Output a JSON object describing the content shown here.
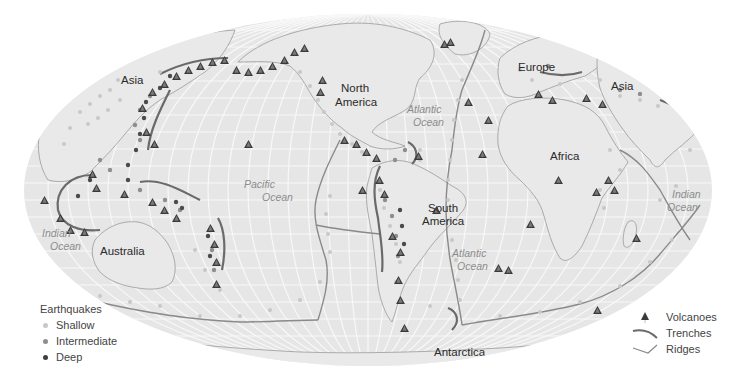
{
  "map": {
    "projection": "Mollweide-style ellipse",
    "land_labels": {
      "asia_west": "Asia",
      "asia_east": "Asia",
      "north_america": "North America",
      "north_america_l1": "North",
      "north_america_l2": "America",
      "south_america_l1": "South",
      "south_america_l2": "America",
      "europe": "Europe",
      "africa": "Africa",
      "australia": "Australia",
      "antarctica": "Antarctica"
    },
    "ocean_labels": {
      "pacific_l1": "Pacific",
      "pacific_l2": "Ocean",
      "atlantic_north_l1": "Atlantic",
      "atlantic_north_l2": "Ocean",
      "atlantic_south_l1": "Atlantic",
      "atlantic_south_l2": "Ocean",
      "indian_west_l1": "Indian",
      "indian_west_l2": "Ocean",
      "indian_east_l1": "Indian",
      "indian_east_l2": "Ocean"
    },
    "colors": {
      "ocean_fill": "#e6e6e6",
      "grid": "#f7f7f7",
      "coast": "#9a9a9a",
      "trench": "#6f6f6f",
      "ridge": "#8a8a8a",
      "shallow": "#c8c8c8",
      "intermediate": "#8e8e8e",
      "deep": "#4a4a4a",
      "volcano": "#3a3a3a"
    }
  },
  "legend_earthquakes": {
    "title": "Earthquakes",
    "items": [
      {
        "label": "Shallow",
        "color": "#c8c8c8"
      },
      {
        "label": "Intermediate",
        "color": "#8e8e8e"
      },
      {
        "label": "Deep",
        "color": "#3f3f3f"
      }
    ]
  },
  "legend_features": {
    "items": [
      {
        "label": "Volcanoes",
        "icon": "volcano-triangle-icon"
      },
      {
        "label": "Trenches",
        "icon": "trench-line-icon"
      },
      {
        "label": "Ridges",
        "icon": "ridge-line-icon"
      }
    ]
  }
}
